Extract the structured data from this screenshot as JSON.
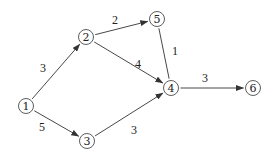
{
  "diagram": {
    "type": "directed-weighted-graph",
    "nodes": [
      {
        "id": "1",
        "label": "1",
        "x": 26,
        "y": 106
      },
      {
        "id": "2",
        "label": "2",
        "x": 86,
        "y": 37
      },
      {
        "id": "3",
        "label": "3",
        "x": 87,
        "y": 141
      },
      {
        "id": "4",
        "label": "4",
        "x": 171,
        "y": 88
      },
      {
        "id": "5",
        "label": "5",
        "x": 157,
        "y": 19
      },
      {
        "id": "6",
        "label": "6",
        "x": 253,
        "y": 88
      }
    ],
    "edges": [
      {
        "from": "1",
        "to": "2",
        "weight": "3",
        "label_x": 43,
        "label_y": 72,
        "arrow": true
      },
      {
        "from": "1",
        "to": "3",
        "weight": "5",
        "label_x": 42,
        "label_y": 131,
        "arrow": true
      },
      {
        "from": "2",
        "to": "5",
        "weight": "2",
        "label_x": 115,
        "label_y": 24,
        "arrow": true
      },
      {
        "from": "2",
        "to": "4",
        "weight": "4",
        "label_x": 138,
        "label_y": 68,
        "arrow": true
      },
      {
        "from": "5",
        "to": "4",
        "weight": "1",
        "label_x": 175,
        "label_y": 55,
        "arrow": false
      },
      {
        "from": "3",
        "to": "4",
        "weight": "3",
        "label_x": 134,
        "label_y": 134,
        "arrow": true
      },
      {
        "from": "4",
        "to": "6",
        "weight": "3",
        "label_x": 205,
        "label_y": 82,
        "arrow": true
      }
    ]
  }
}
